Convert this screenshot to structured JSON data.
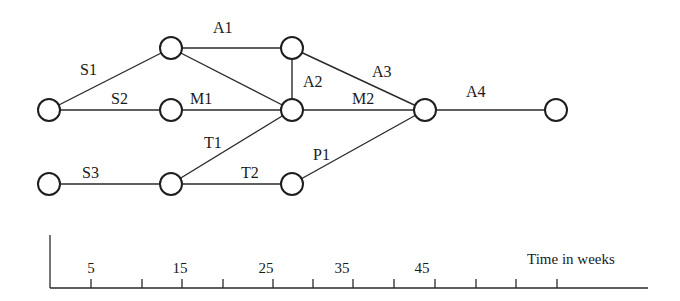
{
  "diagram": {
    "type": "activity-network",
    "nodes": [
      {
        "id": "n0",
        "x": 49,
        "y": 110
      },
      {
        "id": "n1",
        "x": 171,
        "y": 48
      },
      {
        "id": "n2",
        "x": 171,
        "y": 110
      },
      {
        "id": "n3",
        "x": 49,
        "y": 184
      },
      {
        "id": "n4",
        "x": 171,
        "y": 184
      },
      {
        "id": "n5",
        "x": 292,
        "y": 48
      },
      {
        "id": "n6",
        "x": 292,
        "y": 110
      },
      {
        "id": "n7",
        "x": 292,
        "y": 184
      },
      {
        "id": "n8",
        "x": 425,
        "y": 110
      },
      {
        "id": "n9",
        "x": 556,
        "y": 110
      }
    ],
    "edges": [
      {
        "from": "n0",
        "to": "n1",
        "label": "S1",
        "lx": 80,
        "ly": 75
      },
      {
        "from": "n0",
        "to": "n2",
        "label": "S2",
        "lx": 111,
        "ly": 104
      },
      {
        "from": "n3",
        "to": "n4",
        "label": "S3",
        "lx": 82,
        "ly": 178
      },
      {
        "from": "n1",
        "to": "n5",
        "label": "A1",
        "lx": 213,
        "ly": 33
      },
      {
        "from": "n1",
        "to": "n6",
        "label": "",
        "lx": 0,
        "ly": 0
      },
      {
        "from": "n5",
        "to": "n6",
        "label": "A2",
        "lx": 303,
        "ly": 87
      },
      {
        "from": "n2",
        "to": "n6",
        "label": "M1",
        "lx": 190,
        "ly": 104
      },
      {
        "from": "n4",
        "to": "n6",
        "label": "T1",
        "lx": 204,
        "ly": 148
      },
      {
        "from": "n4",
        "to": "n7",
        "label": "T2",
        "lx": 241,
        "ly": 178
      },
      {
        "from": "n5",
        "to": "n8",
        "label": "A3",
        "lx": 372,
        "ly": 77
      },
      {
        "from": "n6",
        "to": "n8",
        "label": "M2",
        "lx": 352,
        "ly": 104
      },
      {
        "from": "n7",
        "to": "n8",
        "label": "P1",
        "lx": 313,
        "ly": 160
      },
      {
        "from": "n8",
        "to": "n9",
        "label": "A4",
        "lx": 466,
        "ly": 97
      }
    ],
    "timeline": {
      "axis_label": "Time in weeks",
      "ticks_x": [
        91,
        142,
        182,
        223,
        273,
        313,
        353,
        394,
        435,
        476,
        516,
        557
      ],
      "tick_labels": [
        {
          "text": "5",
          "x": 91
        },
        {
          "text": "15",
          "x": 180
        },
        {
          "text": "25",
          "x": 266
        },
        {
          "text": "35",
          "x": 342
        },
        {
          "text": "45",
          "x": 422
        }
      ]
    }
  },
  "colors": {
    "line": "#2a2a2a",
    "background": "#ffffff"
  }
}
